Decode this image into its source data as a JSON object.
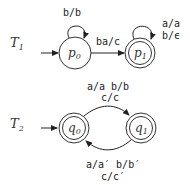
{
  "machines": [
    {
      "name": "T",
      "index": "1",
      "states": [
        {
          "name": "p",
          "index": "0",
          "initial": true,
          "accepting": false
        },
        {
          "name": "p",
          "index": "1",
          "initial": false,
          "accepting": true
        }
      ],
      "transitions": [
        {
          "from": "p0",
          "to": "p0",
          "labels": [
            "b/b"
          ]
        },
        {
          "from": "p0",
          "to": "p1",
          "labels": [
            "ba/c"
          ]
        },
        {
          "from": "p1",
          "to": "p1",
          "labels": [
            "a/a",
            "b/ϵ"
          ]
        }
      ]
    },
    {
      "name": "T",
      "index": "2",
      "states": [
        {
          "name": "q",
          "index": "0",
          "initial": true,
          "accepting": true
        },
        {
          "name": "q",
          "index": "1",
          "initial": false,
          "accepting": true
        }
      ],
      "transitions": [
        {
          "from": "q0",
          "to": "q1",
          "labels": [
            "a/a  b/b",
            "c/c"
          ]
        },
        {
          "from": "q1",
          "to": "q0",
          "labels": [
            "a/a′  b/b′",
            "c/c′"
          ]
        }
      ]
    }
  ]
}
